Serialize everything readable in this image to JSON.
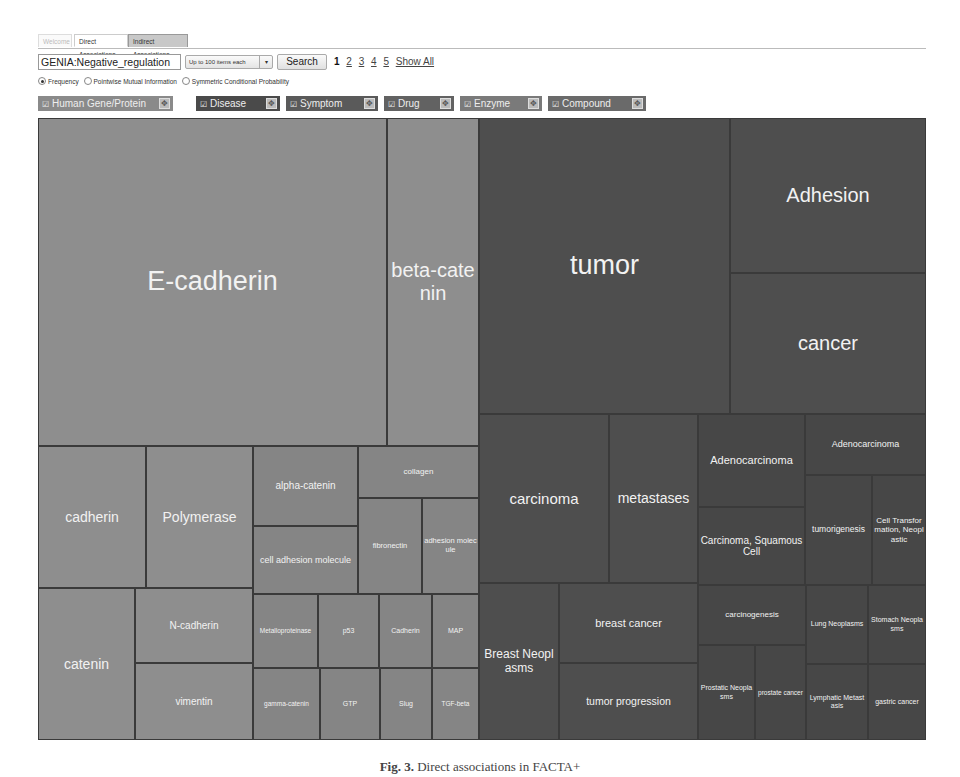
{
  "tabs": [
    {
      "label": "Welcome",
      "state": "faded"
    },
    {
      "label": "Direct Associations",
      "state": "active"
    },
    {
      "label": "Indirect Associations",
      "state": "inactive"
    }
  ],
  "search": {
    "query": "GENIA:Negative_regulation",
    "limit_select": "Up to 100 items each",
    "search_button": "Search",
    "pages": [
      "1",
      "2",
      "3",
      "4",
      "5"
    ],
    "current_page": "1",
    "show_all": "Show All"
  },
  "measures": [
    {
      "label": "Frequency",
      "selected": true
    },
    {
      "label": "Pointwise Mutual Information",
      "selected": false
    },
    {
      "label": "Symmetric Conditional Probability",
      "selected": false
    }
  ],
  "categories": [
    {
      "label": "Human Gene/Protein",
      "checked": true,
      "color": "#8a8a8a"
    },
    {
      "label": "Disease",
      "checked": true,
      "color": "#4a4a4a"
    },
    {
      "label": "Symptom",
      "checked": true,
      "color": "#5a5a5a"
    },
    {
      "label": "Drug",
      "checked": true,
      "color": "#626262"
    },
    {
      "label": "Enzyme",
      "checked": true,
      "color": "#7a7a7a"
    },
    {
      "label": "Compound",
      "checked": true,
      "color": "#6a6a6a"
    }
  ],
  "icons": {
    "checkbox": "☑",
    "expand": "✥",
    "dropdown": "▾"
  },
  "treemap": {
    "gene_protein": [
      {
        "label": "E-cadherin"
      },
      {
        "label": "beta-catenin"
      },
      {
        "label": "cadherin"
      },
      {
        "label": "Polymerase"
      },
      {
        "label": "alpha-catenin"
      },
      {
        "label": "cell adhesion molecule"
      },
      {
        "label": "collagen"
      },
      {
        "label": "fibronectin"
      },
      {
        "label": "adhesion molecule"
      },
      {
        "label": "catenin"
      },
      {
        "label": "N-cadherin"
      },
      {
        "label": "vimentin"
      },
      {
        "label": "Metalloproteinase"
      },
      {
        "label": "p53"
      },
      {
        "label": "Cadherin"
      },
      {
        "label": "MAP"
      },
      {
        "label": "gamma-catenin"
      },
      {
        "label": "GTP"
      },
      {
        "label": "Slug"
      },
      {
        "label": "TGF-beta"
      }
    ],
    "disease": [
      {
        "label": "tumor"
      },
      {
        "label": "Adhesion"
      },
      {
        "label": "cancer"
      },
      {
        "label": "carcinoma"
      },
      {
        "label": "metastases"
      },
      {
        "label": "Adenocarcinoma"
      },
      {
        "label": "Carcinoma, Squamous Cell"
      },
      {
        "label": "Adenocarcinoma"
      },
      {
        "label": "tumorigenesis"
      },
      {
        "label": "Cell Transformation, Neoplastic"
      },
      {
        "label": "Breast Neoplasms"
      },
      {
        "label": "breast cancer"
      },
      {
        "label": "tumor progression"
      },
      {
        "label": "carcinogenesis"
      },
      {
        "label": "Prostatic Neoplasms"
      },
      {
        "label": "prostate cancer"
      },
      {
        "label": "Lung Neoplasms"
      },
      {
        "label": "Stomach Neoplasms"
      },
      {
        "label": "Lymphatic Metastasis"
      },
      {
        "label": "gastric cancer"
      }
    ]
  },
  "caption": {
    "prefix": "Fig. 3.",
    "text": "Direct associations in FACTA+"
  }
}
